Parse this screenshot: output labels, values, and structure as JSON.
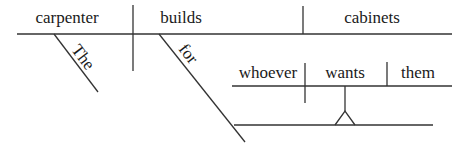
{
  "diagram": {
    "type": "sentence-diagram",
    "sentence": "The carpenter builds cabinets for whoever wants them",
    "main_clause": {
      "subject": "carpenter",
      "verb": "builds",
      "object": "cabinets",
      "subject_modifier": "The",
      "verb_modifier_preposition": "for"
    },
    "noun_clause": {
      "subject": "whoever",
      "verb": "wants",
      "object": "them"
    },
    "colors": {
      "line": "#333333",
      "text": "#1a1a1a",
      "background": "#ffffff"
    }
  }
}
